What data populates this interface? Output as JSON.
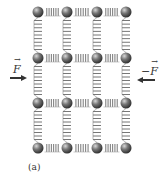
{
  "diagram": {
    "caption": "(a)",
    "grid": {
      "columns": [
        38,
        67,
        97,
        126
      ],
      "rows": [
        12,
        58,
        103,
        148
      ],
      "ball_radius": 5.5
    },
    "colors": {
      "ball_dark": "#4a4a4a",
      "ball_light": "#bdbdbd",
      "spring": "#777777",
      "arrow": "#333333"
    },
    "forces": [
      {
        "label": "F",
        "vector": true,
        "sign": "",
        "direction": "right",
        "side": "left"
      },
      {
        "label": "F",
        "vector": true,
        "sign": "−",
        "direction": "left",
        "side": "right"
      }
    ]
  }
}
